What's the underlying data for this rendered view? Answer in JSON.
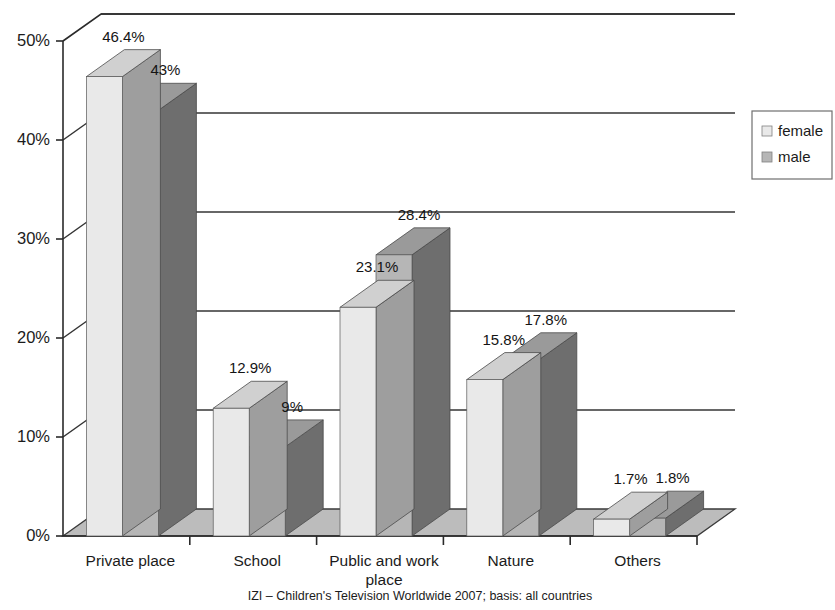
{
  "chart_data": {
    "type": "bar",
    "title": "",
    "subtitle": "",
    "xlabel": "",
    "ylabel": "",
    "categories": [
      "Private place",
      "School",
      "Public and work place",
      "Nature",
      "Others"
    ],
    "series": [
      {
        "name": "female",
        "values": [
          46.4,
          12.9,
          23.1,
          15.8,
          1.7
        ],
        "color": "#e9e9e9"
      },
      {
        "name": "male",
        "values": [
          43,
          9,
          28.4,
          17.8,
          1.8
        ],
        "color": "#b6b6b6"
      }
    ],
    "value_labels": [
      [
        "46.4%",
        "43%"
      ],
      [
        "12.9%",
        "9%"
      ],
      [
        "23.1%",
        "28.4%"
      ],
      [
        "15.8%",
        "17.8%"
      ],
      [
        "1.7%",
        "1.8%"
      ]
    ],
    "ylim": [
      0,
      50
    ],
    "yticks": [
      0,
      10,
      20,
      30,
      40,
      50
    ],
    "ytick_labels": [
      "0%",
      "10%",
      "20%",
      "30%",
      "40%",
      "50%"
    ],
    "grid": true,
    "legend_position": "right",
    "units": "percent",
    "style": "3d-column"
  },
  "legend": {
    "items": [
      {
        "label": "female",
        "swatch_color": "#e9e9e9"
      },
      {
        "label": "male",
        "swatch_color": "#b6b6b6"
      }
    ]
  },
  "footnote": {
    "text": "IZI – Children's Television Worldwide 2007; basis: all countries"
  },
  "category_label_lines": [
    [
      "Private place"
    ],
    [
      "School"
    ],
    [
      "Public and work",
      "place"
    ],
    [
      "Nature"
    ],
    [
      "Others"
    ]
  ],
  "colors": {
    "female_front": "#e9e9e9",
    "female_top": "#d0d0d0",
    "female_side": "#9e9e9e",
    "male_front": "#b6b6b6",
    "male_top": "#9a9a9a",
    "male_side": "#6e6e6e",
    "floor": "#bcbcbc",
    "axis": "#2a2a2a",
    "grid": "#343434",
    "text": "#1b1b1b"
  }
}
